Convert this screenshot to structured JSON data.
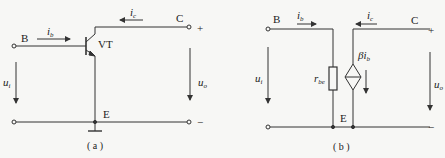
{
  "figure_a": {
    "caption": "( a )",
    "terminal_base": "B",
    "terminal_collector": "C",
    "terminal_emitter": "E",
    "transistor": "VT",
    "current_base": {
      "main": "i",
      "sub": "b"
    },
    "current_collector": {
      "main": "i",
      "sub": "c"
    },
    "voltage_in": {
      "main": "u",
      "sub": "i"
    },
    "voltage_out": {
      "main": "u",
      "sub": "o"
    },
    "plus": "+",
    "minus": "−"
  },
  "figure_b": {
    "caption": "( b )",
    "terminal_base": "B",
    "terminal_collector": "C",
    "terminal_emitter": "E",
    "resistor": {
      "main": "r",
      "sub": "be"
    },
    "source": {
      "main": "βi",
      "sub": "b"
    },
    "current_base": {
      "main": "i",
      "sub": "b"
    },
    "current_collector": {
      "main": "i",
      "sub": "c"
    },
    "voltage_in": {
      "main": "u",
      "sub": "i"
    },
    "voltage_out": {
      "main": "u",
      "sub": "o"
    },
    "plus": "+",
    "minus": "−"
  },
  "colors": {
    "line": "#333333",
    "background": "#f7f7f5"
  }
}
